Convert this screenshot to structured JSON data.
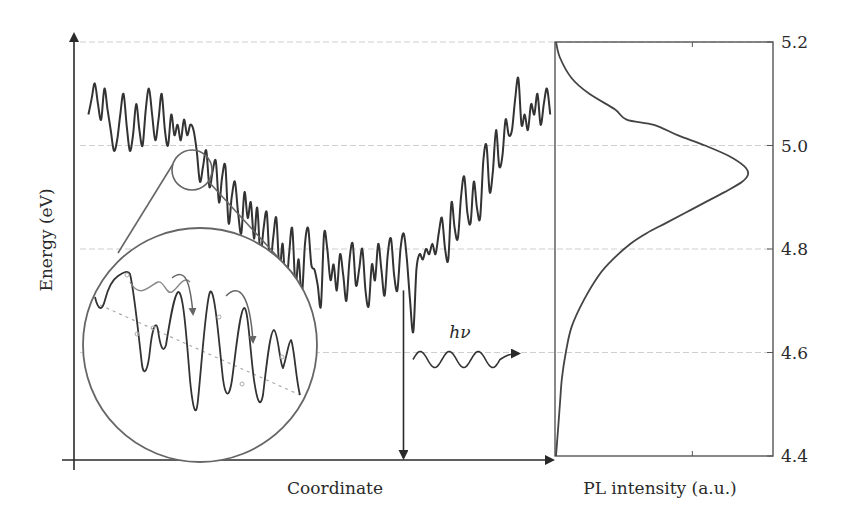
{
  "chart_data": [
    {
      "type": "line",
      "panel": "energy-landscape",
      "title": "",
      "xlabel": "Coordinate",
      "ylabel": "Energy (eV)",
      "ylim": [
        4.4,
        5.2
      ],
      "xlim": [
        0,
        100
      ],
      "grid": true,
      "gridlines_y": [
        4.6,
        4.8,
        5.0,
        5.2
      ],
      "series": [
        {
          "name": "site energy",
          "x_start": 3,
          "x_end": 99,
          "values": [
            5.06,
            5.09,
            5.12,
            5.08,
            5.05,
            5.11,
            5.07,
            5.03,
            4.99,
            5.01,
            5.06,
            5.1,
            5.04,
            4.99,
            5.02,
            5.08,
            5.03,
            5.0,
            5.07,
            5.11,
            5.06,
            5.01,
            5.05,
            5.1,
            5.03,
            5.0,
            5.06,
            5.02,
            5.04,
            5.01,
            5.05,
            5.02,
            5.04,
            5.03,
            4.99,
            4.93,
            4.96,
            4.99,
            4.92,
            4.95,
            4.97,
            4.89,
            4.94,
            4.96,
            4.85,
            4.9,
            4.93,
            4.87,
            4.83,
            4.91,
            4.86,
            4.89,
            4.82,
            4.88,
            4.79,
            4.84,
            4.87,
            4.77,
            4.82,
            4.86,
            4.76,
            4.81,
            4.72,
            4.79,
            4.84,
            4.73,
            4.78,
            4.71,
            4.81,
            4.84,
            4.77,
            4.76,
            4.73,
            4.69,
            4.83,
            4.8,
            4.74,
            4.77,
            4.72,
            4.79,
            4.75,
            4.7,
            4.78,
            4.81,
            4.73,
            4.76,
            4.8,
            4.72,
            4.69,
            4.77,
            4.74,
            4.81,
            4.76,
            4.71,
            4.79,
            4.82,
            4.75,
            4.72,
            4.8,
            4.83,
            4.78,
            4.7,
            4.64,
            4.76,
            4.79,
            4.78,
            4.8,
            4.79,
            4.81,
            4.79,
            4.83,
            4.86,
            4.8,
            4.78,
            4.89,
            4.84,
            4.82,
            4.9,
            4.94,
            4.87,
            4.85,
            4.93,
            4.88,
            4.86,
            4.97,
            5.0,
            4.91,
            4.95,
            5.03,
            4.96,
            4.98,
            5.05,
            5.02,
            5.03,
            5.09,
            5.13,
            5.04,
            5.06,
            5.03,
            5.08,
            5.06,
            5.1,
            5.04,
            5.08,
            5.11,
            5.06
          ]
        }
      ],
      "annotations": [
        {
          "type": "vertical-arrow",
          "from": {
            "x": 68.5,
            "energy": 4.72
          },
          "to": {
            "x": 68.5,
            "energy": 4.39
          }
        },
        {
          "type": "photon-wave",
          "label": "hν",
          "energy": 4.6
        },
        {
          "type": "magnifier",
          "source": {
            "x": 24.5,
            "energy": 4.96
          },
          "description": "zoomed view of energy landscape with hopping arrows"
        }
      ]
    },
    {
      "type": "line",
      "panel": "pl-spectrum",
      "xlabel": "PL intensity (a.u.)",
      "ylabel": "",
      "ylim": [
        4.4,
        5.2
      ],
      "y_ticks": [
        "5.2",
        "5.0",
        "4.8",
        "4.6",
        "4.4"
      ],
      "grid": true,
      "series": [
        {
          "name": "PL",
          "energy": [
            5.2,
            5.17,
            5.13,
            5.1,
            5.07,
            5.05,
            5.04,
            5.02,
            5.0,
            4.98,
            4.96,
            4.945,
            4.93,
            4.91,
            4.89,
            4.87,
            4.85,
            4.83,
            4.81,
            4.78,
            4.75,
            4.7,
            4.65,
            4.6,
            4.55,
            4.5,
            4.45,
            4.4
          ],
          "intensity": [
            0.0,
            0.02,
            0.08,
            0.17,
            0.3,
            0.36,
            0.5,
            0.62,
            0.76,
            0.88,
            0.96,
            0.98,
            0.95,
            0.86,
            0.76,
            0.66,
            0.56,
            0.46,
            0.38,
            0.29,
            0.22,
            0.14,
            0.08,
            0.05,
            0.03,
            0.02,
            0.01,
            0.0
          ]
        }
      ]
    }
  ],
  "labels": {
    "xlabel": "Coordinate",
    "ylabel": "Energy (eV)",
    "pl_xlabel": "PL intensity (a.u.)",
    "photon": "hν",
    "ticks": [
      "5.2",
      "5.0",
      "4.8",
      "4.6",
      "4.4"
    ]
  }
}
